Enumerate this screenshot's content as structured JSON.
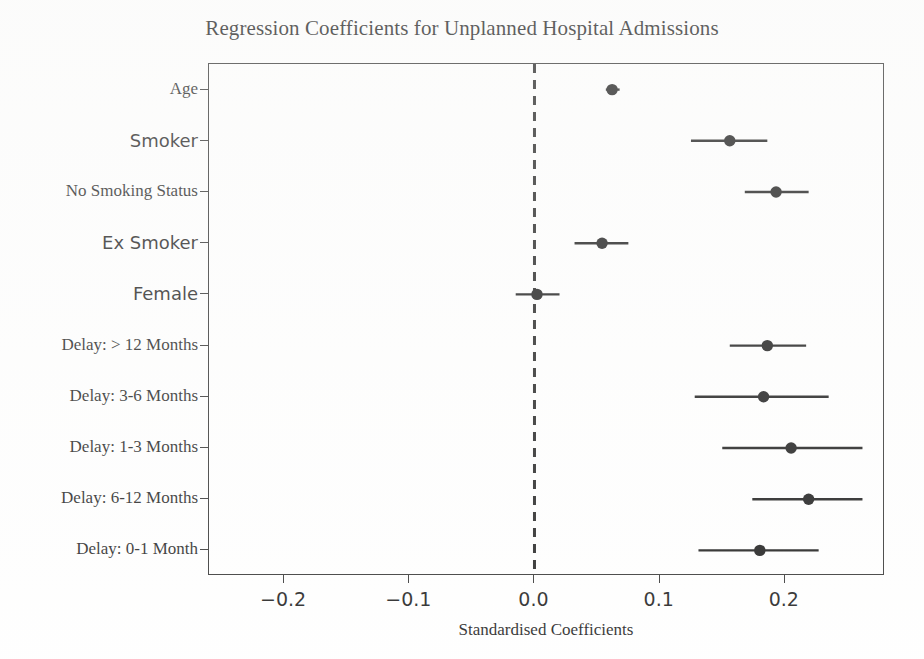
{
  "chart_data": {
    "type": "scatter",
    "title": "Regression Coefficients for Unplanned Hospital Admissions",
    "xlabel": "Standardised Coefficients",
    "ylabel": "",
    "xlim": [
      -0.26,
      0.28
    ],
    "ylim": [
      0,
      10
    ],
    "grid": false,
    "legend": null,
    "reference_line": {
      "value": 0.0,
      "style": "dashed",
      "color": "#1a1a1a"
    },
    "xticks": [
      -0.2,
      -0.1,
      0.0,
      0.1,
      0.2
    ],
    "xticklabels": [
      "−0.2",
      "−0.1",
      "0.0",
      "0.1",
      "0.2"
    ],
    "categories": [
      "Age",
      "Smoker",
      "No Smoking Status",
      "Ex Smoker",
      "Female",
      "Delay: > 12 Months",
      "Delay: 3-6 Months",
      "Delay: 1-3 Months",
      "Delay: 6-12 Months",
      "Delay: 0-1 Month"
    ],
    "label_fonts": [
      "serif",
      "sans",
      "serif",
      "sans",
      "sans",
      "serif",
      "serif",
      "serif",
      "serif",
      "serif"
    ],
    "points": [
      {
        "label": "Age",
        "value": 0.062,
        "ci_low": 0.057,
        "ci_high": 0.068
      },
      {
        "label": "Smoker",
        "value": 0.156,
        "ci_low": 0.125,
        "ci_high": 0.186
      },
      {
        "label": "No Smoking Status",
        "value": 0.193,
        "ci_low": 0.168,
        "ci_high": 0.219
      },
      {
        "label": "Ex Smoker",
        "value": 0.054,
        "ci_low": 0.032,
        "ci_high": 0.075
      },
      {
        "label": "Female",
        "value": 0.002,
        "ci_low": -0.015,
        "ci_high": 0.02
      },
      {
        "label": "Delay: > 12 Months",
        "value": 0.186,
        "ci_low": 0.156,
        "ci_high": 0.217
      },
      {
        "label": "Delay: 3-6 Months",
        "value": 0.183,
        "ci_low": 0.128,
        "ci_high": 0.235
      },
      {
        "label": "Delay: 1-3 Months",
        "value": 0.205,
        "ci_low": 0.15,
        "ci_high": 0.262
      },
      {
        "label": "Delay: 6-12 Months",
        "value": 0.219,
        "ci_low": 0.174,
        "ci_high": 0.262
      },
      {
        "label": "Delay: 0-1 Month",
        "value": 0.18,
        "ci_low": 0.131,
        "ci_high": 0.227
      }
    ],
    "marker": {
      "shape": "circle",
      "color": "#111111",
      "size": 9
    },
    "errorbar": {
      "color": "#111111",
      "linewidth": 2.4
    }
  }
}
